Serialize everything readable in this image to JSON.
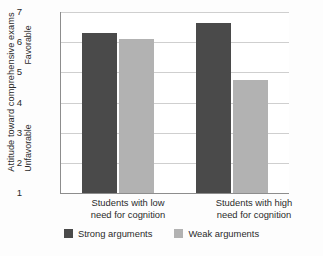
{
  "chart_data": {
    "type": "bar",
    "title": "",
    "xlabel": "",
    "ylabel": "Attitude toward comprehensive exams",
    "categories": [
      "Students with low need for cognition",
      "Students with high need for cognition"
    ],
    "category_lines": [
      [
        "Students with low",
        "need for cognition"
      ],
      [
        "Students with high",
        "need for cognition"
      ]
    ],
    "series": [
      {
        "name": "Strong arguments",
        "color": "#4a4a4a",
        "values": [
          6.3,
          6.65
        ]
      },
      {
        "name": "Weak arguments",
        "color": "#b2b2b2",
        "values": [
          6.1,
          4.75
        ]
      }
    ],
    "ylim": [
      1,
      7
    ],
    "yticks": [
      1,
      2,
      3,
      4,
      5,
      6,
      7
    ],
    "ytick_labels": [
      "1",
      "2",
      "3",
      "4",
      "5",
      "6",
      "7"
    ],
    "y_axis_anchors": {
      "high": "Favorable",
      "low": "Unfavorable"
    },
    "grid": true,
    "legend_position": "bottom"
  },
  "legend": {
    "entries": [
      {
        "label": "Strong arguments"
      },
      {
        "label": "Weak arguments"
      }
    ]
  }
}
